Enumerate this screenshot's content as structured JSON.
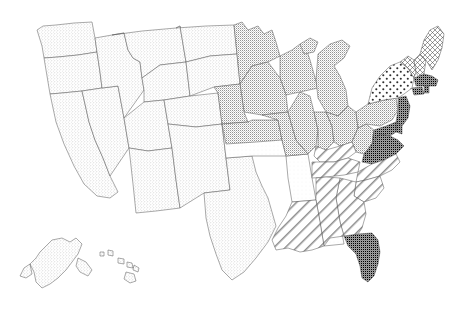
{
  "map": {
    "title": "United States choropleth pattern map",
    "projection": "albers-usa",
    "background_color": "#ffffff",
    "border_color": "#555555",
    "insets": [
      "Alaska",
      "Hawaii"
    ],
    "legend_visible": false,
    "labels_visible": false
  },
  "patterns": {
    "light_stipple": {
      "name": "light-stipple",
      "dot_color": "#9a9a9a",
      "spacing": 3,
      "radius": 0.42,
      "fill": "#ffffff"
    },
    "dense_stipple": {
      "name": "dense-stipple",
      "dot_color": "#707070",
      "spacing": 2,
      "radius": 0.5,
      "fill": "#ffffff"
    },
    "coarse_dots": {
      "name": "coarse-dots",
      "dot_color": "#333333",
      "spacing": 7,
      "radius": 1.0,
      "fill": "#ffffff"
    },
    "cross_hatch": {
      "name": "cross-hatch-grid",
      "line_color": "#4a4a4a",
      "spacing": 5,
      "fill": "#ffffff"
    },
    "diagonal_hatch": {
      "name": "diagonal-hatch",
      "line_color": "#777777",
      "spacing": 8,
      "angle_deg": 45,
      "fill": "#ffffff"
    },
    "solid_gray": {
      "name": "solid-gray",
      "fill": "#9d9d9d"
    },
    "blank": {
      "name": "blank-white",
      "fill": "#ffffff"
    }
  },
  "states": [
    {
      "code": "WA",
      "name": "Washington",
      "pattern": "light_stipple"
    },
    {
      "code": "OR",
      "name": "Oregon",
      "pattern": "light_stipple"
    },
    {
      "code": "CA",
      "name": "California",
      "pattern": "light_stipple"
    },
    {
      "code": "NV",
      "name": "Nevada",
      "pattern": "light_stipple"
    },
    {
      "code": "ID",
      "name": "Idaho",
      "pattern": "light_stipple"
    },
    {
      "code": "MT",
      "name": "Montana",
      "pattern": "light_stipple"
    },
    {
      "code": "WY",
      "name": "Wyoming",
      "pattern": "light_stipple"
    },
    {
      "code": "UT",
      "name": "Utah",
      "pattern": "light_stipple"
    },
    {
      "code": "AZ",
      "name": "Arizona",
      "pattern": "light_stipple"
    },
    {
      "code": "CO",
      "name": "Colorado",
      "pattern": "light_stipple"
    },
    {
      "code": "NM",
      "name": "New Mexico",
      "pattern": "light_stipple"
    },
    {
      "code": "ND",
      "name": "North Dakota",
      "pattern": "light_stipple"
    },
    {
      "code": "SD",
      "name": "South Dakota",
      "pattern": "light_stipple"
    },
    {
      "code": "TX",
      "name": "Texas",
      "pattern": "light_stipple"
    },
    {
      "code": "OK",
      "name": "Oklahoma",
      "pattern": "blank"
    },
    {
      "code": "AR",
      "name": "Arkansas",
      "pattern": "blank"
    },
    {
      "code": "MS",
      "name": "Mississippi",
      "pattern": "blank"
    },
    {
      "code": "MN",
      "name": "Minnesota",
      "pattern": "dense_stipple"
    },
    {
      "code": "WI",
      "name": "Wisconsin",
      "pattern": "dense_stipple"
    },
    {
      "code": "MI",
      "name": "Michigan",
      "pattern": "dense_stipple"
    },
    {
      "code": "IA",
      "name": "Iowa",
      "pattern": "dense_stipple"
    },
    {
      "code": "NE",
      "name": "Nebraska",
      "pattern": "dense_stipple"
    },
    {
      "code": "KS",
      "name": "Kansas",
      "pattern": "dense_stipple"
    },
    {
      "code": "MO",
      "name": "Missouri",
      "pattern": "dense_stipple"
    },
    {
      "code": "IL",
      "name": "Illinois",
      "pattern": "dense_stipple"
    },
    {
      "code": "IN",
      "name": "Indiana",
      "pattern": "dense_stipple"
    },
    {
      "code": "OH",
      "name": "Ohio",
      "pattern": "dense_stipple"
    },
    {
      "code": "WV",
      "name": "West Virginia",
      "pattern": "dense_stipple"
    },
    {
      "code": "PA",
      "name": "Pennsylvania",
      "pattern": "dense_stipple"
    },
    {
      "code": "NY",
      "name": "New York",
      "pattern": "coarse_dots"
    },
    {
      "code": "VT",
      "name": "Vermont",
      "pattern": "cross_hatch"
    },
    {
      "code": "NH",
      "name": "New Hampshire",
      "pattern": "cross_hatch"
    },
    {
      "code": "ME",
      "name": "Maine",
      "pattern": "cross_hatch"
    },
    {
      "code": "MA",
      "name": "Massachusetts",
      "pattern": "solid_gray"
    },
    {
      "code": "CT",
      "name": "Connecticut",
      "pattern": "solid_gray"
    },
    {
      "code": "RI",
      "name": "Rhode Island",
      "pattern": "solid_gray"
    },
    {
      "code": "NJ",
      "name": "New Jersey",
      "pattern": "solid_gray"
    },
    {
      "code": "DE",
      "name": "Delaware",
      "pattern": "solid_gray"
    },
    {
      "code": "MD",
      "name": "Maryland",
      "pattern": "solid_gray"
    },
    {
      "code": "VA",
      "name": "Virginia",
      "pattern": "solid_gray"
    },
    {
      "code": "FL",
      "name": "Florida",
      "pattern": "solid_gray"
    },
    {
      "code": "KY",
      "name": "Kentucky",
      "pattern": "diagonal_hatch"
    },
    {
      "code": "TN",
      "name": "Tennessee",
      "pattern": "diagonal_hatch"
    },
    {
      "code": "NC",
      "name": "North Carolina",
      "pattern": "diagonal_hatch"
    },
    {
      "code": "SC",
      "name": "South Carolina",
      "pattern": "diagonal_hatch"
    },
    {
      "code": "GA",
      "name": "Georgia",
      "pattern": "diagonal_hatch"
    },
    {
      "code": "AL",
      "name": "Alabama",
      "pattern": "diagonal_hatch"
    },
    {
      "code": "LA",
      "name": "Louisiana",
      "pattern": "diagonal_hatch"
    },
    {
      "code": "AK",
      "name": "Alaska",
      "pattern": "light_stipple"
    },
    {
      "code": "HI",
      "name": "Hawaii",
      "pattern": "light_stipple"
    }
  ]
}
